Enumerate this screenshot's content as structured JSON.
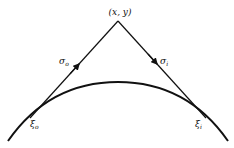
{
  "diagram": {
    "apex_label": "(x, y)",
    "left_ray": {
      "symbol": "σ",
      "subscript": "o"
    },
    "right_ray": {
      "symbol": "σ",
      "subscript": "i"
    },
    "left_tangent_point": {
      "symbol": "ξ",
      "subscript": "o"
    },
    "right_tangent_point": {
      "symbol": "ξ",
      "subscript": "i"
    },
    "colors": {
      "stroke": "#111111",
      "background": "#ffffff"
    }
  }
}
